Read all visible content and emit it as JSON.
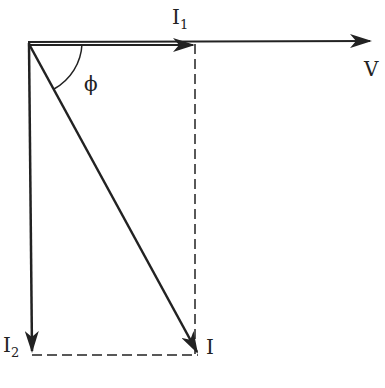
{
  "diagram": {
    "type": "phasor-diagram",
    "colors": {
      "line": "#222222",
      "background": "#ffffff"
    },
    "labels": {
      "v": "V",
      "i1_main": "I",
      "i1_sub": "1",
      "i2_main": "I",
      "i2_sub": "2",
      "i": "I",
      "phi": "ϕ"
    },
    "vectors": [
      {
        "name": "V",
        "from": [
          28,
          42
        ],
        "to": [
          372,
          41
        ]
      },
      {
        "name": "I1",
        "from": [
          28,
          43
        ],
        "to": [
          195,
          43
        ]
      },
      {
        "name": "I2",
        "from": [
          28,
          43
        ],
        "to": [
          32,
          353
        ]
      },
      {
        "name": "I",
        "from": [
          28,
          43
        ],
        "to": [
          198,
          353
        ]
      }
    ]
  }
}
